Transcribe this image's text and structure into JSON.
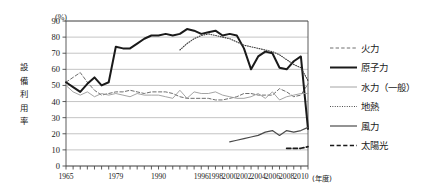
{
  "chart_data": {
    "type": "line",
    "title": "",
    "unit_label": "(%)",
    "ylabel": "設備利用率",
    "xlabel": "(年度)",
    "ylim": [
      0,
      90
    ],
    "yticks": [
      0,
      10,
      20,
      30,
      40,
      50,
      60,
      70,
      80,
      90
    ],
    "grid": true,
    "legend_position": "right",
    "x": [
      1965,
      1967,
      1969,
      1971,
      1973,
      1975,
      1977,
      1979,
      1981,
      1983,
      1985,
      1987,
      1989,
      1990,
      1991,
      1992,
      1993,
      1994,
      1995,
      1996,
      1997,
      1998,
      1999,
      2000,
      2001,
      2002,
      2003,
      2004,
      2005,
      2006,
      2007,
      2008,
      2009,
      2010,
      2011
    ],
    "tick_labels": [
      "1965",
      "",
      "",
      "",
      "",
      "",
      "",
      "1979",
      "",
      "",
      "",
      "",
      "",
      "1990",
      "",
      "",
      "",
      "",
      "",
      "1996",
      "",
      "1998",
      "",
      "2000",
      "",
      "2002",
      "",
      "2004",
      "",
      "2006",
      "",
      "2008",
      "",
      "2010",
      ""
    ],
    "series": [
      {
        "name": "火力",
        "style": "dashed-thin",
        "color": "#6e6e6e",
        "values": [
          52,
          55,
          58,
          52,
          47,
          44,
          45,
          46,
          46,
          47,
          46,
          45,
          46,
          46,
          46,
          45,
          43,
          42,
          42,
          42,
          42,
          41,
          41,
          42,
          43,
          45,
          45,
          44,
          44,
          44,
          48,
          46,
          43,
          44,
          51
        ]
      },
      {
        "name": "原子力",
        "style": "solid-thick",
        "color": "#1a1a1a",
        "values": [
          52,
          49,
          46,
          51,
          55,
          50,
          52,
          74,
          73,
          73,
          76,
          79,
          81,
          81,
          82,
          81,
          82,
          85,
          84,
          82,
          83,
          84,
          81,
          82,
          81,
          73,
          60,
          68,
          71,
          70,
          61,
          60,
          65,
          68,
          23
        ]
      },
      {
        "name": "水力（一般）",
        "style": "solid-thin",
        "color": "#9a9a9a",
        "values": [
          50,
          46,
          44,
          46,
          43,
          45,
          44,
          45,
          44,
          43,
          45,
          44,
          44,
          44,
          43,
          42,
          47,
          42,
          46,
          45,
          45,
          46,
          44,
          43,
          42,
          42,
          43,
          45,
          42,
          46,
          41,
          43,
          44,
          45,
          45
        ]
      },
      {
        "name": "地熱",
        "style": "dotted",
        "color": "#3a3a3a",
        "values": [
          null,
          null,
          null,
          null,
          null,
          null,
          null,
          null,
          null,
          null,
          null,
          null,
          null,
          null,
          null,
          null,
          72,
          76,
          79,
          81,
          82,
          81,
          80,
          79,
          77,
          75,
          74,
          73,
          72,
          71,
          69,
          66,
          63,
          61,
          53
        ]
      },
      {
        "name": "風力",
        "style": "solid-med",
        "color": "#4a4a4a",
        "values": [
          null,
          null,
          null,
          null,
          null,
          null,
          null,
          null,
          null,
          null,
          null,
          null,
          null,
          null,
          null,
          null,
          null,
          null,
          null,
          null,
          null,
          null,
          null,
          15,
          16,
          17,
          18,
          19,
          21,
          22,
          19,
          22,
          21,
          22,
          24
        ]
      },
      {
        "name": "太陽光",
        "style": "dashed-thick",
        "color": "#1a1a1a",
        "values": [
          null,
          null,
          null,
          null,
          null,
          null,
          null,
          null,
          null,
          null,
          null,
          null,
          null,
          null,
          null,
          null,
          null,
          null,
          null,
          null,
          null,
          null,
          null,
          null,
          null,
          null,
          null,
          null,
          null,
          null,
          null,
          11,
          11,
          11,
          12
        ]
      }
    ]
  },
  "legend": {
    "items": [
      {
        "label": "火力"
      },
      {
        "label": "原子力"
      },
      {
        "label": "水力（一般）"
      },
      {
        "label": "地熱"
      },
      {
        "label": "風力"
      },
      {
        "label": "太陽光"
      }
    ]
  }
}
